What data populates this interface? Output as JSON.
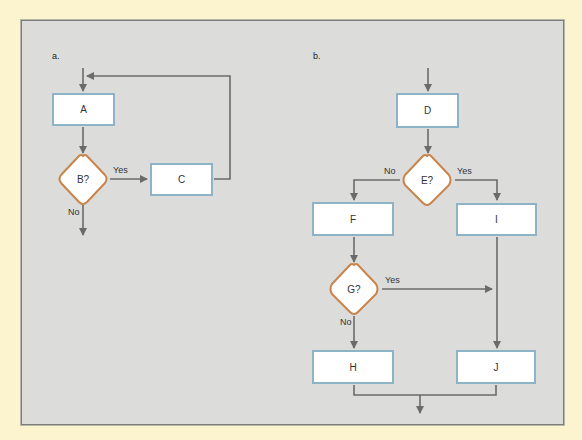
{
  "colors": {
    "page_background": "#fbf4cf",
    "panel_background": "#dcdcdb",
    "box_border": "#8fb3c6",
    "diamond_border": "#c8844a",
    "line": "#6b6b6b"
  },
  "diagram_a": {
    "label": "a.",
    "nodes": {
      "A": {
        "text": "A",
        "shape": "process"
      },
      "B": {
        "text": "B?",
        "shape": "decision"
      },
      "C": {
        "text": "C",
        "shape": "process"
      }
    },
    "edges": {
      "b_yes": "Yes",
      "b_no": "No"
    }
  },
  "diagram_b": {
    "label": "b.",
    "nodes": {
      "D": {
        "text": "D",
        "shape": "process"
      },
      "E": {
        "text": "E?",
        "shape": "decision"
      },
      "F": {
        "text": "F",
        "shape": "process"
      },
      "I": {
        "text": "I",
        "shape": "process"
      },
      "G": {
        "text": "G?",
        "shape": "decision"
      },
      "H": {
        "text": "H",
        "shape": "process"
      },
      "J": {
        "text": "J",
        "shape": "process"
      }
    },
    "edges": {
      "e_no": "No",
      "e_yes": "Yes",
      "g_yes": "Yes",
      "g_no": "No"
    }
  }
}
